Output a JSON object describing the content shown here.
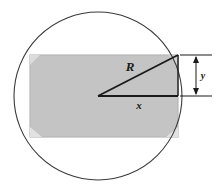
{
  "figure": {
    "background_color": "#ffffff",
    "stroke_color": "#1a1a1a",
    "rectangle_fill": "#c4c4c4",
    "rectangle_edge_color": "#b0b0b0",
    "circle_stroke": "#3a3a3a",
    "labels": {
      "radius": "R",
      "half_width": "x",
      "half_height": "y"
    },
    "geometry": {
      "circle": {
        "cx": 98,
        "cy": 96,
        "r": 84
      },
      "rectangle": {
        "x": 30,
        "y": 55,
        "width": 148,
        "height": 82
      },
      "center_point": {
        "x": 98,
        "y": 96
      },
      "corner_point": {
        "x": 178,
        "y": 55
      },
      "dimension_line_x": 196,
      "dimension_top_y": 55,
      "dimension_bottom_y": 96
    },
    "label_positions": {
      "radius": {
        "x": 130,
        "y": 71
      },
      "half_width": {
        "x": 139,
        "y": 109
      },
      "half_height": {
        "x": 203,
        "y": 79
      }
    }
  }
}
